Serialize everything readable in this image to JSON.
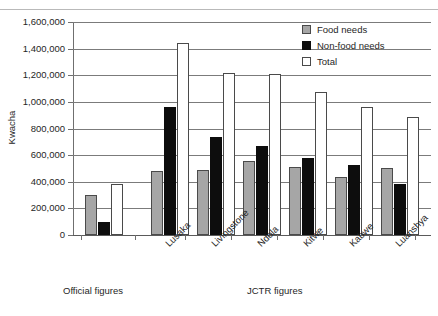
{
  "chart_data": {
    "type": "bar",
    "title": "",
    "subtitle": "",
    "xlabel": "",
    "ylabel": "Kwacha",
    "ylim": [
      0,
      1600000
    ],
    "ytick_step": 200000,
    "ytick_labels": [
      "1,600,000",
      "1,400,000",
      "1,200,000",
      "1,000,000",
      "800,000",
      "600,000",
      "400,000",
      "200,000",
      "0"
    ],
    "ytick_values": [
      1600000,
      1400000,
      1200000,
      1000000,
      800000,
      600000,
      400000,
      200000,
      0
    ],
    "grid": true,
    "legend_position": "top-right",
    "categories": [
      "",
      "Lusaka",
      "Livingstone",
      "Ndola",
      "Kitwe",
      "Kabwe",
      "Luanshya"
    ],
    "group_labels": [
      "Official figures",
      "JCTR figures"
    ],
    "series": [
      {
        "name": "Food needs",
        "color": "#a6a6a6",
        "values": [
          300000,
          480000,
          490000,
          555000,
          510000,
          435000,
          505000
        ]
      },
      {
        "name": "Non-food needs",
        "color": "#0d0d0d",
        "values": [
          95000,
          965000,
          735000,
          670000,
          580000,
          525000,
          385000
        ]
      },
      {
        "name": "Total",
        "color": "#ffffff",
        "values": [
          380000,
          1440000,
          1220000,
          1210000,
          1075000,
          965000,
          890000
        ]
      }
    ]
  },
  "axis": {
    "y_title": "Kwacha"
  },
  "legend": {
    "items": [
      {
        "label": "Food needs",
        "key": "food"
      },
      {
        "label": "Non-food needs",
        "key": "nonfood"
      },
      {
        "label": "Total",
        "key": "total"
      }
    ]
  },
  "groups": {
    "official": "Official figures",
    "jctr": "JCTR figures"
  }
}
